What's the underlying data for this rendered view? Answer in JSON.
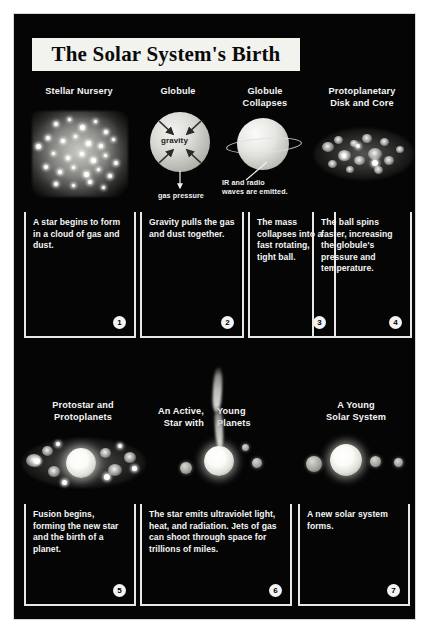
{
  "poster": {
    "title": "The Solar System's Birth",
    "background_color": "#050505",
    "text_color": "#f5f5f5",
    "frame_color": "#d8d8d8"
  },
  "panels": [
    {
      "number": "1",
      "heading": "Stellar Nursery",
      "caption": "A star begins to form in a cloud of gas and dust.",
      "artwork": "nebula-cloud-with-stars",
      "labels": []
    },
    {
      "number": "2",
      "heading": "Globule",
      "caption": "Gravity pulls the gas and dust together.",
      "artwork": "globule-sphere-with-gravity-arrows",
      "labels": [
        "gravity",
        "gas pressure"
      ]
    },
    {
      "number": "3",
      "heading": "Globule Collapses",
      "caption": "The mass collapses into a fast rotating, tight ball.",
      "artwork": "collapsing-sphere-with-ring",
      "labels": [
        "IR and radio waves are emitted."
      ]
    },
    {
      "number": "4",
      "heading": "Protoplanetary Disk and Core",
      "caption": "The ball spins faster, increasing the globule's pressure and temperature.",
      "artwork": "protoplanetary-disk",
      "labels": []
    },
    {
      "number": "5",
      "heading": "Protostar and Protoplanets",
      "caption": "Fusion begins, forming the new star and the birth of a planet.",
      "artwork": "protostar-with-protoplanet-disk",
      "labels": []
    },
    {
      "number": "6",
      "heading_line1": "An Active,",
      "heading_line2": "Star  with",
      "heading_line3": "Young",
      "heading_line4": "Planets",
      "heading": "An Active, Young Star with Planets",
      "caption": "The star emits ultraviolet light, heat, and radiation. Jets of gas can shoot through space for trillions of miles.",
      "artwork": "young-star-with-gas-jet-and-planets",
      "labels": []
    },
    {
      "number": "7",
      "heading": "A Young Solar System",
      "caption": "A new solar system forms.",
      "artwork": "star-with-planets-row",
      "labels": []
    }
  ],
  "headings": {
    "p1": "Stellar Nursery",
    "p2": "Globule",
    "p3_l1": "Globule",
    "p3_l2": "Collapses",
    "p4_l1": "Protoplanetary",
    "p4_l2": "Disk and Core",
    "p5_l1": "Protostar and",
    "p5_l2": "Protoplanets",
    "p6_l1": "An Active,",
    "p6_l2": "Star  with",
    "p6_r1": "Young",
    "p6_r2": "Planets",
    "p7_l1": "A Young",
    "p7_l2": "Solar System"
  },
  "captions": {
    "c1": "A star begins to form in a cloud of gas and dust.",
    "c2": "Gravity pulls the gas and dust together.",
    "c3": "The mass collapses into a fast rotating, tight ball.",
    "c4": "The ball spins faster, increasing the globule's pressure and temperature.",
    "c5": "Fusion begins, forming the new star and the birth of a planet.",
    "c6": "The star emits ultraviolet light, heat, and radiation. Jets of gas can shoot through space for trillions of miles.",
    "c7": "A new solar system forms."
  },
  "badges": {
    "b1": "1",
    "b2": "2",
    "b3": "3",
    "b4": "4",
    "b5": "5",
    "b6": "6",
    "b7": "7"
  },
  "annotations": {
    "gravity": "gravity",
    "gas_pressure": "gas pressure",
    "ir_radio_l1": "IR and radio",
    "ir_radio_l2": "waves are emitted."
  }
}
